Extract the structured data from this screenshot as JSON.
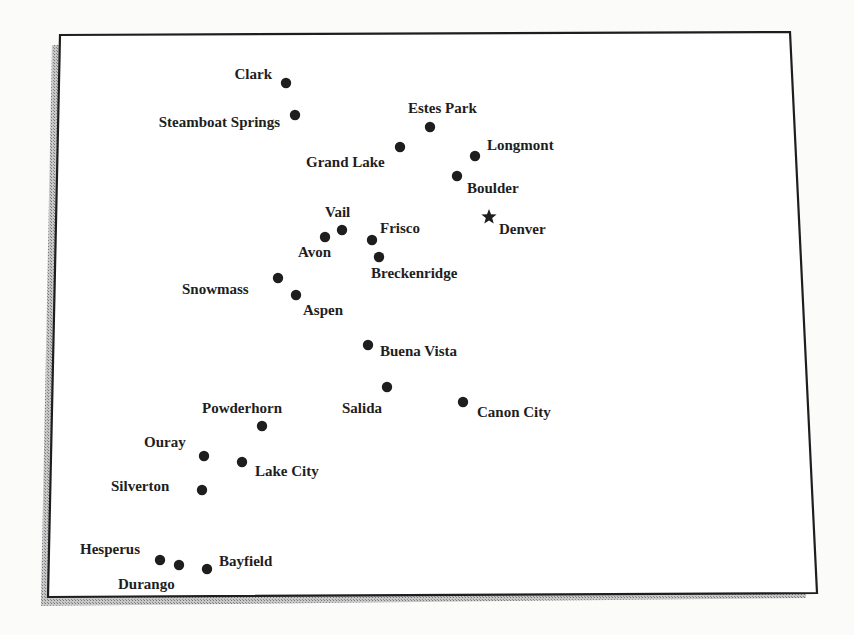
{
  "map": {
    "region": "Colorado",
    "colors": {
      "ink": "#1e1e1e",
      "paper": "#ffffff",
      "background": "#fbfbfa",
      "shadow": "#9a9a9a"
    },
    "capital": {
      "name": "Denver",
      "icon": "star-icon"
    },
    "towns": [
      {
        "name": "Clark",
        "icon": "dot-icon",
        "label_side": "left"
      },
      {
        "name": "Steamboat Springs",
        "icon": "dot-icon",
        "label_side": "left"
      },
      {
        "name": "Estes Park",
        "icon": "dot-icon",
        "label_side": "above"
      },
      {
        "name": "Grand Lake",
        "icon": "dot-icon",
        "label_side": "below-left"
      },
      {
        "name": "Longmont",
        "icon": "dot-icon",
        "label_side": "right"
      },
      {
        "name": "Boulder",
        "icon": "dot-icon",
        "label_side": "below-right"
      },
      {
        "name": "Vail",
        "icon": "dot-icon",
        "label_side": "above"
      },
      {
        "name": "Avon",
        "icon": "dot-icon",
        "label_side": "below"
      },
      {
        "name": "Frisco",
        "icon": "dot-icon",
        "label_side": "right"
      },
      {
        "name": "Breckenridge",
        "icon": "dot-icon",
        "label_side": "below"
      },
      {
        "name": "Snowmass",
        "icon": "dot-icon",
        "label_side": "left"
      },
      {
        "name": "Aspen",
        "icon": "dot-icon",
        "label_side": "below-right"
      },
      {
        "name": "Buena Vista",
        "icon": "dot-icon",
        "label_side": "right"
      },
      {
        "name": "Salida",
        "icon": "dot-icon",
        "label_side": "below"
      },
      {
        "name": "Canon City",
        "icon": "dot-icon",
        "label_side": "right"
      },
      {
        "name": "Powderhorn",
        "icon": "dot-icon",
        "label_side": "above"
      },
      {
        "name": "Ouray",
        "icon": "dot-icon",
        "label_side": "left"
      },
      {
        "name": "Lake City",
        "icon": "dot-icon",
        "label_side": "right"
      },
      {
        "name": "Silverton",
        "icon": "dot-icon",
        "label_side": "left"
      },
      {
        "name": "Hesperus",
        "icon": "dot-icon",
        "label_side": "left"
      },
      {
        "name": "Durango",
        "icon": "dot-icon",
        "label_side": "below"
      },
      {
        "name": "Bayfield",
        "icon": "dot-icon",
        "label_side": "right"
      }
    ]
  }
}
